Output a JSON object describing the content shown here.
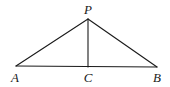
{
  "diagram": {
    "type": "geometry",
    "points": {
      "P": {
        "label": "P",
        "x": 88,
        "y": 19,
        "label_x": 88,
        "label_y": 14
      },
      "A": {
        "label": "A",
        "x": 16,
        "y": 66,
        "label_x": 15,
        "label_y": 82
      },
      "B": {
        "label": "B",
        "x": 157,
        "y": 67,
        "label_x": 157,
        "label_y": 82
      },
      "C": {
        "label": "C",
        "x": 88,
        "y": 67,
        "label_x": 88,
        "label_y": 82
      }
    },
    "segments": [
      {
        "from": "A",
        "to": "P"
      },
      {
        "from": "P",
        "to": "B"
      },
      {
        "from": "A",
        "to": "B"
      },
      {
        "from": "P",
        "to": "C"
      }
    ],
    "colors": {
      "stroke": "#1a1a1a",
      "background": "#ffffff"
    }
  }
}
